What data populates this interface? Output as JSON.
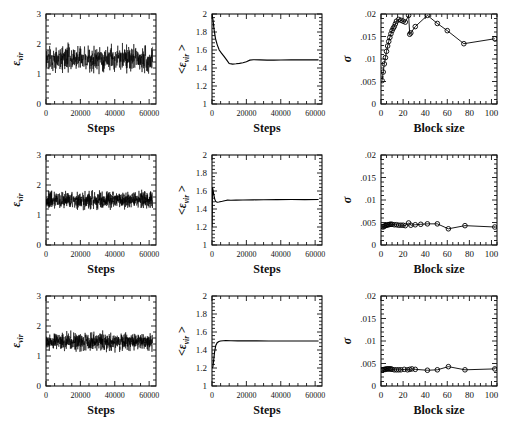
{
  "figure": {
    "rows": 3,
    "cols": 3,
    "background": "#ffffff",
    "ink": "#000000"
  },
  "labels": {
    "epsilon": "ε",
    "sub_vir": "vir",
    "avg_open": "<",
    "avg_close": ">",
    "sigma": "σ",
    "steps": "Steps",
    "block_size": "Block size"
  },
  "chart_data": [
    {
      "id": "r1c1",
      "type": "line",
      "title": "",
      "xlabel": "Steps",
      "ylabel": "ε_vir",
      "xlim": [
        0,
        64000
      ],
      "ylim": [
        0,
        3
      ],
      "xticks": [
        0,
        20000,
        40000,
        60000
      ],
      "xticklabels": [
        "0",
        "20000",
        "40000",
        "60000"
      ],
      "yticks": [
        0,
        1,
        2,
        3
      ],
      "yticklabels": [
        "0",
        "1",
        "2",
        "3"
      ],
      "grid": false,
      "legend": null,
      "series": [
        {
          "name": "instantaneous virial energy",
          "description": "Noisy time trace fluctuating about 1.5 with spread roughly 0.75 to 2.6",
          "mean": 1.5,
          "noise_amplitude": 0.33,
          "min": 0.72,
          "max": 2.62,
          "n_points": 620
        }
      ]
    },
    {
      "id": "r1c2",
      "type": "line",
      "xlabel": "Steps",
      "ylabel": "<ε_vir>",
      "xlim": [
        0,
        64000
      ],
      "ylim": [
        1,
        2
      ],
      "xticks": [
        0,
        20000,
        40000,
        60000
      ],
      "xticklabels": [
        "0",
        "20000",
        "40000",
        "60000"
      ],
      "yticks": [
        1,
        1.2,
        1.4,
        1.6,
        1.8,
        2
      ],
      "yticklabels": [
        "1",
        "1.2",
        "1.4",
        "1.6",
        "1.8",
        "2"
      ],
      "grid": false,
      "series": [
        {
          "name": "running average of virial energy",
          "description": "Starts near 2.0, decays steeply to ~1.45 by 10000 steps, dips then plateaus at ~1.49",
          "x": [
            0,
            600,
            1200,
            2000,
            3000,
            4200,
            5500,
            7000,
            8500,
            10000,
            12000,
            14000,
            16000,
            18000,
            20000,
            22000,
            24000,
            28000,
            32000,
            36000,
            40000,
            46000,
            52000,
            58000,
            62000
          ],
          "y": [
            2.0,
            1.93,
            1.83,
            1.73,
            1.66,
            1.6,
            1.565,
            1.53,
            1.49,
            1.45,
            1.443,
            1.447,
            1.452,
            1.458,
            1.47,
            1.487,
            1.492,
            1.49,
            1.488,
            1.488,
            1.489,
            1.49,
            1.49,
            1.491,
            1.491
          ]
        }
      ]
    },
    {
      "id": "r1c3",
      "type": "line",
      "xlabel": "Block size",
      "ylabel": "σ",
      "xlim": [
        0,
        105
      ],
      "ylim": [
        0,
        0.02
      ],
      "xticks": [
        0,
        20,
        40,
        60,
        80,
        100
      ],
      "xticklabels": [
        "0",
        "20",
        "40",
        "60",
        "80",
        "100"
      ],
      "yticks": [
        0,
        0.005,
        0.01,
        0.015,
        0.02
      ],
      "yticklabels": [
        "0",
        ".005",
        ".01",
        ".015",
        ".02"
      ],
      "grid": false,
      "marker": "open-circle",
      "series": [
        {
          "name": "block-average standard deviation",
          "description": "Rises steeply from .005 at block size 1 to ~.019 near block size 10, dips at 25, peaks ~.0197 at 42, then decays to ~.0135 at 75 and rises slightly to ~.0145 at 103",
          "x": [
            1,
            2,
            3,
            4,
            5,
            6,
            7,
            8,
            9,
            10,
            11,
            12,
            13,
            14,
            16,
            18,
            20,
            22,
            25,
            26,
            27,
            31,
            42,
            51,
            60,
            75,
            103
          ],
          "y": [
            0.0052,
            0.0071,
            0.0089,
            0.0103,
            0.0117,
            0.0129,
            0.0139,
            0.0148,
            0.0156,
            0.0163,
            0.0168,
            0.0172,
            0.0178,
            0.0184,
            0.0188,
            0.0186,
            0.0184,
            0.0182,
            0.0197,
            0.0155,
            0.0158,
            0.0172,
            0.0197,
            0.0179,
            0.0163,
            0.0134,
            0.0145
          ]
        }
      ]
    },
    {
      "id": "r2c1",
      "type": "line",
      "xlabel": "Steps",
      "ylabel": "ε_vir",
      "xlim": [
        0,
        64000
      ],
      "ylim": [
        0,
        3
      ],
      "xticks": [
        0,
        20000,
        40000,
        60000
      ],
      "xticklabels": [
        "0",
        "20000",
        "40000",
        "60000"
      ],
      "yticks": [
        0,
        1,
        2,
        3
      ],
      "yticklabels": [
        "0",
        "1",
        "2",
        "3"
      ],
      "grid": false,
      "series": [
        {
          "name": "instantaneous virial energy",
          "description": "Dense noisy trace centered at 1.5 with tighter band roughly 1.05 to 2.0",
          "mean": 1.5,
          "noise_amplitude": 0.22,
          "min": 1.0,
          "max": 2.3,
          "n_points": 900
        }
      ]
    },
    {
      "id": "r2c2",
      "type": "line",
      "xlabel": "Steps",
      "ylabel": "<ε_vir>",
      "xlim": [
        0,
        64000
      ],
      "ylim": [
        1,
        2
      ],
      "xticks": [
        0,
        20000,
        40000,
        60000
      ],
      "xticklabels": [
        "0",
        "20000",
        "40000",
        "60000"
      ],
      "yticks": [
        1,
        1.2,
        1.4,
        1.6,
        1.8,
        2
      ],
      "yticklabels": [
        "1",
        "1.2",
        "1.4",
        "1.6",
        "1.8",
        "2"
      ],
      "grid": false,
      "series": [
        {
          "name": "running average of virial energy",
          "description": "Spikes to ~1.65 immediately, drops sharply to ~1.47 by 2500 steps and stays flat at ~1.505",
          "x": [
            0,
            300,
            700,
            1100,
            1600,
            2200,
            3000,
            4000,
            6000,
            8000,
            9000,
            11000,
            14000,
            18000,
            24000,
            30000,
            38000,
            46000,
            54000,
            62000
          ],
          "y": [
            1.2,
            1.64,
            1.6,
            1.55,
            1.51,
            1.482,
            1.475,
            1.478,
            1.486,
            1.495,
            1.498,
            1.497,
            1.499,
            1.5,
            1.502,
            1.503,
            1.504,
            1.505,
            1.505,
            1.506
          ]
        }
      ]
    },
    {
      "id": "r2c3",
      "type": "line",
      "xlabel": "Block size",
      "ylabel": "σ",
      "xlim": [
        0,
        105
      ],
      "ylim": [
        0,
        0.02
      ],
      "xticks": [
        0,
        20,
        40,
        60,
        80,
        100
      ],
      "xticklabels": [
        "0",
        "20",
        "40",
        "60",
        "80",
        "100"
      ],
      "yticks": [
        0,
        0.005,
        0.01,
        0.015,
        0.02
      ],
      "yticklabels": [
        "0",
        ".005",
        ".01",
        ".015",
        ".02"
      ],
      "grid": false,
      "marker": "open-circle",
      "series": [
        {
          "name": "block-average standard deviation",
          "description": "Essentially flat near .0042-.0048 across all block sizes with a dip to .0036 near block size 61",
          "x": [
            1,
            2,
            3,
            4,
            5,
            6,
            7,
            8,
            9,
            10,
            12,
            14,
            16,
            18,
            20,
            22,
            25,
            27,
            31,
            36,
            42,
            51,
            61,
            76,
            103
          ],
          "y": [
            0.0041,
            0.004,
            0.0042,
            0.0043,
            0.0044,
            0.0045,
            0.0045,
            0.0046,
            0.0046,
            0.0046,
            0.0045,
            0.0045,
            0.0044,
            0.0044,
            0.0044,
            0.0043,
            0.0049,
            0.0044,
            0.0045,
            0.0046,
            0.0047,
            0.0047,
            0.0036,
            0.0043,
            0.004
          ]
        }
      ]
    },
    {
      "id": "r3c1",
      "type": "line",
      "xlabel": "Steps",
      "ylabel": "ε_vir",
      "xlim": [
        0,
        64000
      ],
      "ylim": [
        0,
        3
      ],
      "xticks": [
        0,
        20000,
        40000,
        60000
      ],
      "xticklabels": [
        "0",
        "20000",
        "40000",
        "60000"
      ],
      "yticks": [
        0,
        1,
        2,
        3
      ],
      "yticklabels": [
        "0",
        "1",
        "2",
        "3"
      ],
      "grid": false,
      "series": [
        {
          "name": "instantaneous virial energy",
          "description": "Dense noisy trace centered at 1.48 with band roughly 1.05 to 2.05",
          "mean": 1.48,
          "noise_amplitude": 0.21,
          "min": 1.02,
          "max": 2.12,
          "n_points": 900
        }
      ]
    },
    {
      "id": "r3c2",
      "type": "line",
      "xlabel": "Steps",
      "ylabel": "<ε_vir>",
      "xlim": [
        0,
        64000
      ],
      "ylim": [
        1,
        2
      ],
      "xticks": [
        0,
        20000,
        40000,
        60000
      ],
      "xticklabels": [
        "0",
        "20000",
        "40000",
        "60000"
      ],
      "yticks": [
        1,
        1.2,
        1.4,
        1.6,
        1.8,
        2
      ],
      "yticklabels": [
        "1",
        "1.2",
        "1.4",
        "1.6",
        "1.8",
        "2"
      ],
      "grid": false,
      "series": [
        {
          "name": "running average of virial energy",
          "description": "Starts at ~1.2, rises steeply to ~1.5 within 4000 steps, then flat at ~1.5 for the rest",
          "x": [
            0,
            500,
            1000,
            1500,
            2200,
            3000,
            4000,
            5000,
            6500,
            8000,
            11000,
            15000,
            20000,
            26000,
            33000,
            40000,
            48000,
            56000,
            62000
          ],
          "y": [
            1.2,
            1.21,
            1.29,
            1.38,
            1.45,
            1.481,
            1.495,
            1.5,
            1.503,
            1.504,
            1.503,
            1.502,
            1.501,
            1.501,
            1.5,
            1.5,
            1.5,
            1.5,
            1.5
          ]
        }
      ]
    },
    {
      "id": "r3c3",
      "type": "line",
      "xlabel": "Block size",
      "ylabel": "σ",
      "xlim": [
        0,
        105
      ],
      "ylim": [
        0,
        0.02
      ],
      "xticks": [
        0,
        20,
        40,
        60,
        80,
        100
      ],
      "xticklabels": [
        "0",
        "20",
        "40",
        "60",
        "80",
        "100"
      ],
      "yticks": [
        0,
        0.005,
        0.01,
        0.015,
        0.02
      ],
      "yticklabels": [
        "0",
        ".005",
        ".01",
        ".015",
        ".02"
      ],
      "grid": false,
      "marker": "open-circle",
      "series": [
        {
          "name": "block-average standard deviation",
          "description": "Flat near .0035-.0040 with a small bump to .0043 near block size 61",
          "x": [
            1,
            2,
            3,
            4,
            5,
            6,
            7,
            8,
            9,
            10,
            12,
            14,
            16,
            18,
            21,
            24,
            26,
            28,
            31,
            42,
            51,
            61,
            76,
            103
          ],
          "y": [
            0.0036,
            0.0036,
            0.0037,
            0.0037,
            0.0038,
            0.0038,
            0.0038,
            0.0038,
            0.0038,
            0.0037,
            0.0036,
            0.0036,
            0.0036,
            0.0036,
            0.0037,
            0.0036,
            0.0037,
            0.0038,
            0.0037,
            0.0035,
            0.0036,
            0.0043,
            0.0036,
            0.0038
          ]
        }
      ]
    }
  ]
}
